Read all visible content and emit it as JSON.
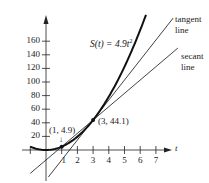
{
  "chart_data": {
    "type": "line",
    "title": "",
    "xlabel": "t",
    "ylabel": "",
    "xlim": [
      -1,
      7.8
    ],
    "ylim": [
      -45,
      195
    ],
    "grid": false,
    "x_ticks": [
      -1,
      1,
      2,
      3,
      4,
      5,
      6,
      7
    ],
    "x_tick_labels": [
      "1",
      "2",
      "3",
      "4",
      "5",
      "6",
      "7"
    ],
    "y_ticks": [
      20,
      40,
      60,
      80,
      100,
      120,
      140,
      160
    ],
    "y_tick_labels": [
      "20",
      "40",
      "60",
      "80",
      "100",
      "120",
      "140",
      "160"
    ],
    "series": [
      {
        "name": "S(t) = 4.9t²",
        "kind": "curve",
        "formula": "4.9*t^2",
        "t_range": [
          -1,
          6.37
        ],
        "stroke_width": 2
      },
      {
        "name": "tangent line",
        "kind": "line",
        "point": [
          3,
          44.1
        ],
        "slope": 29.4,
        "t_range": [
          0.15,
          8.1
        ],
        "stroke_width": 0.8
      },
      {
        "name": "secant line",
        "kind": "line",
        "point": [
          1,
          4.9
        ],
        "slope": 19.6,
        "t_range": [
          -1,
          8.4
        ],
        "stroke_width": 0.8
      }
    ],
    "points": [
      {
        "x": 1,
        "y": 4.9,
        "label": "(1, 4.9)"
      },
      {
        "x": 3,
        "y": 44.1,
        "label": "(3, 44.1)"
      }
    ],
    "annotations": [
      "S(t) = 4.9t²",
      "tangent line",
      "secant line",
      "(1, 4.9)",
      "(3, 44.1)"
    ]
  },
  "labels": {
    "function": "S(t) = 4.9t",
    "function_exp": "2",
    "tangent_1": "tangent",
    "tangent_2": "line",
    "secant_1": "secant",
    "secant_2": "line",
    "point1": "(1, 4.9)",
    "point2": "(3, 44.1)",
    "arrow_down": "↓",
    "x_axis": "t"
  }
}
